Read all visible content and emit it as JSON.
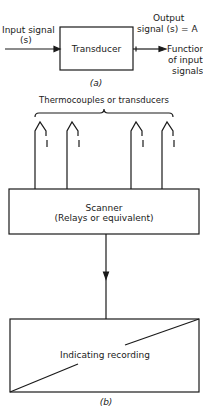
{
  "figure_a": {
    "input_label_line1": "Input signal",
    "input_label_line2": "(s)",
    "block_label": "Transducer",
    "output_label_line1": "Output",
    "output_label_line2": "signal (s) = A",
    "function_line1": "Function",
    "function_line2": "of input",
    "function_line3": "signals",
    "caption": "(a)"
  },
  "figure_b": {
    "sensors_label": "Thermocouples or transducers",
    "scanner_line1": "Scanner",
    "scanner_line2": "(Relays or equivalent)",
    "recorder_label": "Indicating recording",
    "caption": "(b)"
  },
  "colors": {
    "line": "#1a1a1a",
    "background": "#ffffff"
  }
}
